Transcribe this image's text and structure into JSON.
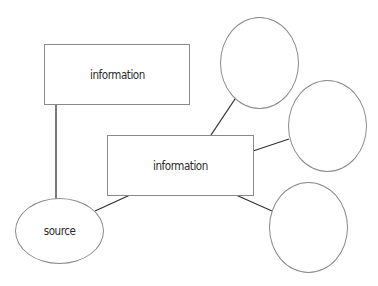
{
  "diagram": {
    "nodes": [
      {
        "id": "info-top",
        "shape": "rectangle",
        "label": "information"
      },
      {
        "id": "info-center",
        "shape": "rectangle",
        "label": "information"
      },
      {
        "id": "source",
        "shape": "ellipse",
        "label": "source"
      },
      {
        "id": "ellipse-top",
        "shape": "ellipse",
        "label": ""
      },
      {
        "id": "ellipse-right",
        "shape": "ellipse",
        "label": ""
      },
      {
        "id": "ellipse-bottom",
        "shape": "ellipse",
        "label": ""
      }
    ],
    "edges": [
      {
        "from": "info-top",
        "to": "source"
      },
      {
        "from": "source",
        "to": "info-center"
      },
      {
        "from": "info-center",
        "to": "ellipse-top"
      },
      {
        "from": "info-center",
        "to": "ellipse-right"
      },
      {
        "from": "info-center",
        "to": "ellipse-bottom"
      }
    ],
    "colors": {
      "stroke": "#8a8a8a",
      "edge": "#333333",
      "text": "#2a2a2a",
      "background": "#ffffff"
    }
  }
}
